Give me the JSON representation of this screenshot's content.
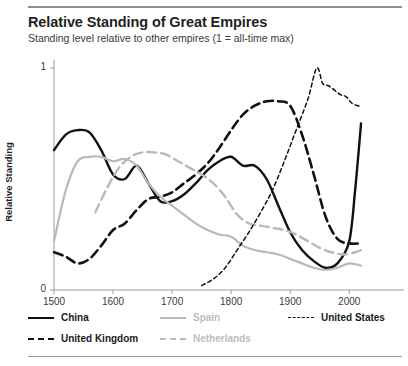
{
  "header": {
    "title": "Relative Standing of Great Empires",
    "subtitle": "Standing level relative to other empires (1 = all-time max)"
  },
  "colors": {
    "black": "#111111",
    "gray": "#b9b9b9",
    "axis": "#9a9a9a",
    "text": "#2b2b2b"
  },
  "legend": [
    {
      "label": "China",
      "style": "solid-black"
    },
    {
      "label": "Spain",
      "style": "solid-gray"
    },
    {
      "label": "United States",
      "style": "fine-dash-black"
    },
    {
      "label": "United Kingdom",
      "style": "dash-black"
    },
    {
      "label": "Netherlands",
      "style": "dash-gray"
    }
  ],
  "chart_data": {
    "type": "line",
    "title": "Relative Standing of Great Empires",
    "subtitle": "Standing level relative to other empires (1 = all-time max)",
    "xlabel": "",
    "ylabel": "Relative Standing",
    "xlim": [
      1500,
      2025
    ],
    "ylim": [
      0,
      1
    ],
    "xticks": [
      1500,
      1600,
      1700,
      1800,
      1900,
      2000
    ],
    "yticks": [
      0,
      1
    ],
    "grid": false,
    "legend_position": "bottom",
    "series": [
      {
        "name": "China",
        "style": "solid",
        "color": "#111111",
        "x": [
          1500,
          1520,
          1540,
          1560,
          1580,
          1600,
          1620,
          1640,
          1660,
          1680,
          1700,
          1720,
          1740,
          1760,
          1780,
          1800,
          1820,
          1840,
          1860,
          1880,
          1900,
          1920,
          1940,
          1960,
          1980,
          2000,
          2010,
          2020
        ],
        "y": [
          0.63,
          0.7,
          0.72,
          0.71,
          0.63,
          0.52,
          0.5,
          0.56,
          0.48,
          0.4,
          0.4,
          0.43,
          0.48,
          0.54,
          0.58,
          0.6,
          0.56,
          0.56,
          0.5,
          0.38,
          0.26,
          0.18,
          0.13,
          0.1,
          0.12,
          0.22,
          0.45,
          0.75
        ]
      },
      {
        "name": "United Kingdom",
        "style": "dashed",
        "color": "#111111",
        "x": [
          1500,
          1520,
          1540,
          1560,
          1580,
          1600,
          1620,
          1640,
          1660,
          1680,
          1700,
          1720,
          1740,
          1760,
          1780,
          1800,
          1820,
          1840,
          1860,
          1880,
          1900,
          1920,
          1940,
          1960,
          1980,
          2000,
          2020
        ],
        "y": [
          0.17,
          0.15,
          0.12,
          0.14,
          0.2,
          0.27,
          0.3,
          0.36,
          0.41,
          0.42,
          0.44,
          0.48,
          0.52,
          0.57,
          0.64,
          0.72,
          0.79,
          0.83,
          0.85,
          0.85,
          0.83,
          0.7,
          0.52,
          0.33,
          0.23,
          0.21,
          0.21
        ]
      },
      {
        "name": "Spain",
        "style": "solid",
        "color": "#b9b9b9",
        "x": [
          1500,
          1520,
          1540,
          1560,
          1580,
          1600,
          1620,
          1640,
          1660,
          1680,
          1700,
          1720,
          1740,
          1760,
          1780,
          1800,
          1820,
          1840,
          1860,
          1880,
          1900,
          1920,
          1940,
          1960,
          1980,
          2000,
          2020
        ],
        "y": [
          0.22,
          0.45,
          0.58,
          0.6,
          0.6,
          0.58,
          0.59,
          0.56,
          0.48,
          0.42,
          0.38,
          0.34,
          0.3,
          0.27,
          0.25,
          0.24,
          0.2,
          0.18,
          0.17,
          0.16,
          0.14,
          0.12,
          0.1,
          0.09,
          0.1,
          0.12,
          0.11
        ]
      },
      {
        "name": "Netherlands",
        "style": "dashed",
        "color": "#b9b9b9",
        "x": [
          1570,
          1590,
          1610,
          1630,
          1650,
          1670,
          1690,
          1710,
          1730,
          1750,
          1770,
          1790,
          1810,
          1830,
          1850,
          1870,
          1890,
          1910,
          1930,
          1950,
          1970,
          1990,
          2010,
          2020
        ],
        "y": [
          0.35,
          0.46,
          0.55,
          0.6,
          0.62,
          0.62,
          0.61,
          0.58,
          0.55,
          0.52,
          0.48,
          0.42,
          0.34,
          0.3,
          0.29,
          0.28,
          0.27,
          0.25,
          0.22,
          0.19,
          0.17,
          0.16,
          0.17,
          0.18
        ]
      },
      {
        "name": "United States",
        "style": "fine-dashed",
        "color": "#111111",
        "x": [
          1750,
          1770,
          1790,
          1810,
          1830,
          1850,
          1870,
          1890,
          1910,
          1930,
          1945,
          1955,
          1965,
          1975,
          1985,
          1995,
          2005,
          2015,
          2020
        ],
        "y": [
          0.02,
          0.05,
          0.1,
          0.18,
          0.26,
          0.35,
          0.45,
          0.58,
          0.72,
          0.86,
          1.0,
          0.93,
          0.92,
          0.9,
          0.88,
          0.87,
          0.84,
          0.83,
          0.83
        ]
      }
    ]
  }
}
